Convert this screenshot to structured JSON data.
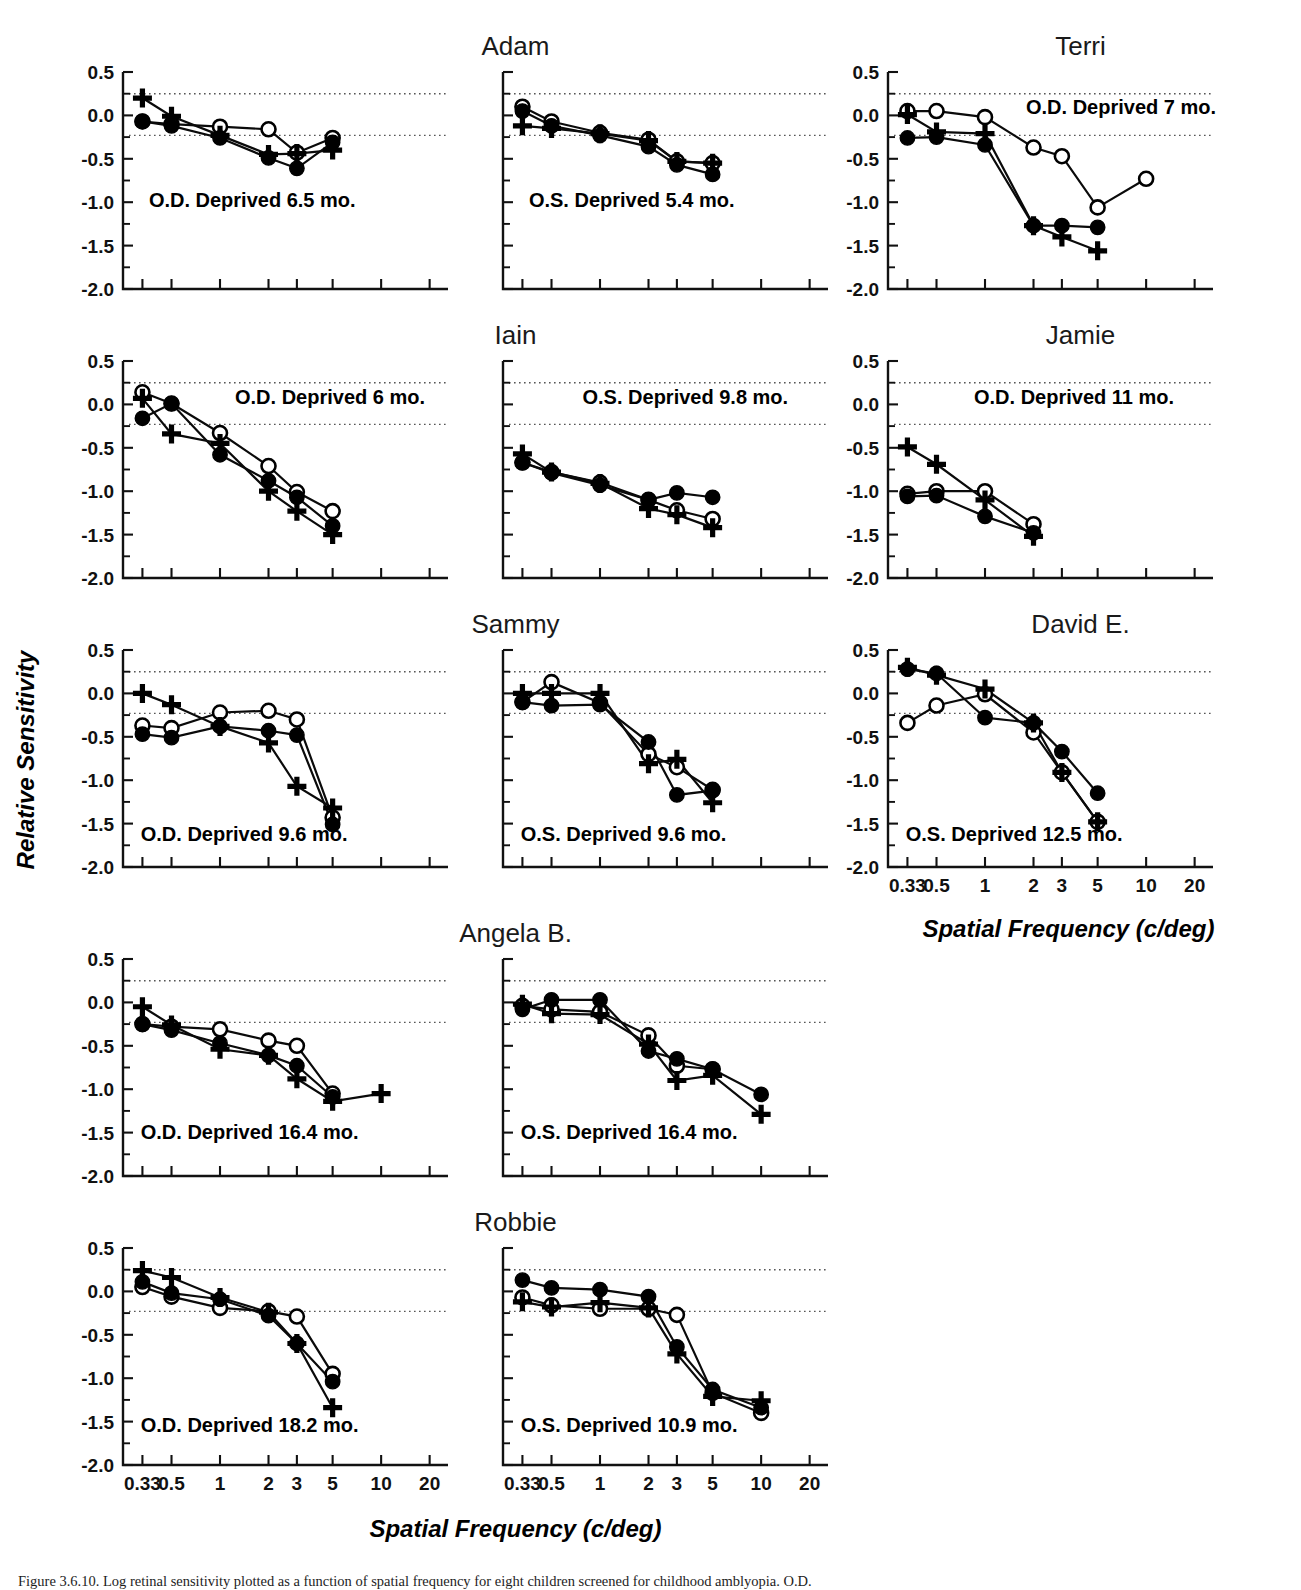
{
  "figure": {
    "axis_labels": {
      "x": "Spatial Frequency (c/deg)",
      "y": "Relative Sensitivity"
    },
    "caption": "Figure 3.6.10.  Log retinal sensitivity plotted as a function of spatial frequency for eight children screened for childhood amblyopia. O.D."
  },
  "chart_data": {
    "type": "line",
    "title": "",
    "xlabel": "Spatial Frequency (c/deg)",
    "ylabel": "Relative Sensitivity",
    "xscale": "log",
    "xlim": [
      0.25,
      26
    ],
    "ylim": [
      -2.0,
      0.5
    ],
    "yticks": [
      0.5,
      0.0,
      -0.5,
      -1.0,
      -1.5,
      -2.0
    ],
    "ytick_labels": [
      "0.5",
      "0.0",
      "-0.5",
      "-1.0",
      "-1.5",
      "-2.0"
    ],
    "xticks": [
      0.33,
      0.5,
      1,
      2,
      3,
      5,
      10,
      20
    ],
    "xtick_labels": [
      "0.33",
      "0.5",
      "1",
      "2",
      "3",
      "5",
      "10",
      "20"
    ],
    "grid": false,
    "reference_lines": [
      0.25,
      -0.23
    ],
    "legend_position": "none",
    "series_names": [
      "open-circle",
      "filled-circle",
      "plus"
    ],
    "panels": [
      {
        "subject": "Adam",
        "eye": "O.D.",
        "annotation": "O.D.  Deprived 6.5 mo.",
        "row": 0,
        "col": 0,
        "series": [
          {
            "name": "open-circle",
            "marker": "open-circle",
            "x": [
              0.33,
              0.5,
              1,
              2,
              3,
              5
            ],
            "y": [
              -0.07,
              -0.1,
              -0.13,
              -0.16,
              -0.43,
              -0.26
            ]
          },
          {
            "name": "filled-circle",
            "marker": "filled-circle",
            "x": [
              0.33,
              0.5,
              1,
              2,
              3,
              5
            ],
            "y": [
              -0.07,
              -0.12,
              -0.26,
              -0.49,
              -0.61,
              -0.31
            ]
          },
          {
            "name": "plus",
            "marker": "plus",
            "x": [
              0.33,
              0.5,
              1,
              2,
              3,
              5
            ],
            "y": [
              0.2,
              -0.01,
              -0.23,
              -0.45,
              -0.44,
              -0.4
            ]
          }
        ]
      },
      {
        "subject": "Adam",
        "eye": "O.S.",
        "annotation": "O.S.  Deprived 5.4 mo.",
        "row": 0,
        "col": 1,
        "series": [
          {
            "name": "open-circle",
            "marker": "open-circle",
            "x": [
              0.33,
              0.5,
              1,
              2,
              3,
              5
            ],
            "y": [
              0.1,
              -0.07,
              -0.2,
              -0.28,
              -0.53,
              -0.55
            ]
          },
          {
            "name": "filled-circle",
            "marker": "filled-circle",
            "x": [
              0.33,
              0.5,
              1,
              2,
              3,
              5
            ],
            "y": [
              0.05,
              -0.12,
              -0.23,
              -0.36,
              -0.57,
              -0.68
            ]
          },
          {
            "name": "plus",
            "marker": "plus",
            "x": [
              0.33,
              0.5,
              1,
              2,
              3,
              5
            ],
            "y": [
              -0.12,
              -0.15,
              -0.21,
              -0.29,
              -0.53,
              -0.55
            ]
          }
        ]
      },
      {
        "subject": "Terri",
        "eye": "O.D.",
        "annotation": "O.D. Deprived 7 mo.",
        "row": 0,
        "col": 2,
        "series": [
          {
            "name": "open-circle",
            "marker": "open-circle",
            "x": [
              0.33,
              0.5,
              1,
              2,
              3,
              5,
              10
            ],
            "y": [
              0.05,
              0.05,
              -0.02,
              -0.37,
              -0.47,
              -1.06,
              -0.73
            ]
          },
          {
            "name": "filled-circle",
            "marker": "filled-circle",
            "x": [
              0.33,
              0.5,
              1,
              2,
              3,
              5
            ],
            "y": [
              -0.26,
              -0.25,
              -0.34,
              -1.27,
              -1.27,
              -1.29
            ]
          },
          {
            "name": "plus",
            "marker": "plus",
            "x": [
              0.33,
              0.5,
              1,
              2,
              3,
              5
            ],
            "y": [
              0.01,
              -0.19,
              -0.21,
              -1.27,
              -1.4,
              -1.56
            ]
          }
        ]
      },
      {
        "subject": "Iain",
        "eye": "O.D.",
        "annotation": "O.D. Deprived 6 mo.",
        "row": 1,
        "col": 0,
        "series": [
          {
            "name": "open-circle",
            "marker": "open-circle",
            "x": [
              0.33,
              0.5,
              1,
              2,
              3,
              5
            ],
            "y": [
              0.14,
              0.01,
              -0.33,
              -0.71,
              -1.01,
              -1.23
            ]
          },
          {
            "name": "filled-circle",
            "marker": "filled-circle",
            "x": [
              0.33,
              0.5,
              1,
              2,
              3,
              5
            ],
            "y": [
              -0.16,
              0.01,
              -0.58,
              -0.88,
              -1.07,
              -1.4
            ]
          },
          {
            "name": "plus",
            "marker": "plus",
            "x": [
              0.33,
              0.5,
              1,
              2,
              3,
              5
            ],
            "y": [
              0.07,
              -0.34,
              -0.45,
              -1.0,
              -1.23,
              -1.5
            ]
          }
        ]
      },
      {
        "subject": "Iain",
        "eye": "O.S.",
        "annotation": "O.S. Deprived 9.8 mo.",
        "row": 1,
        "col": 1,
        "series": [
          {
            "name": "open-circle",
            "marker": "open-circle",
            "x": [
              0.33,
              0.5,
              1,
              2,
              3,
              5
            ],
            "y": [
              -0.67,
              -0.78,
              -0.9,
              -1.1,
              -1.22,
              -1.32
            ]
          },
          {
            "name": "filled-circle",
            "marker": "filled-circle",
            "x": [
              0.33,
              0.5,
              1,
              2,
              3,
              5
            ],
            "y": [
              -0.67,
              -0.79,
              -0.93,
              -1.1,
              -1.02,
              -1.07
            ]
          },
          {
            "name": "plus",
            "marker": "plus",
            "x": [
              0.33,
              0.5,
              1,
              2,
              3,
              5
            ],
            "y": [
              -0.57,
              -0.78,
              -0.91,
              -1.2,
              -1.27,
              -1.42
            ]
          }
        ]
      },
      {
        "subject": "Jamie",
        "eye": "O.D.",
        "annotation": "O.D.  Deprived 11 mo.",
        "row": 1,
        "col": 2,
        "series": [
          {
            "name": "open-circle",
            "marker": "open-circle",
            "x": [
              0.33,
              0.5,
              1,
              2
            ],
            "y": [
              -1.03,
              -1.0,
              -1.0,
              -1.38
            ]
          },
          {
            "name": "filled-circle",
            "marker": "filled-circle",
            "x": [
              0.33,
              0.5,
              1,
              2
            ],
            "y": [
              -1.06,
              -1.05,
              -1.29,
              -1.48
            ]
          },
          {
            "name": "plus",
            "marker": "plus",
            "x": [
              0.33,
              0.5,
              1,
              2
            ],
            "y": [
              -0.49,
              -0.69,
              -1.1,
              -1.52
            ]
          }
        ]
      },
      {
        "subject": "Sammy",
        "eye": "O.D.",
        "annotation": "O.D. Deprived 9.6 mo.",
        "row": 2,
        "col": 0,
        "series": [
          {
            "name": "open-circle",
            "marker": "open-circle",
            "x": [
              0.33,
              0.5,
              1,
              2,
              3,
              5
            ],
            "y": [
              -0.37,
              -0.4,
              -0.22,
              -0.2,
              -0.3,
              -1.43
            ]
          },
          {
            "name": "filled-circle",
            "marker": "filled-circle",
            "x": [
              0.33,
              0.5,
              1,
              2,
              3,
              5
            ],
            "y": [
              -0.47,
              -0.51,
              -0.38,
              -0.43,
              -0.48,
              -1.51
            ]
          },
          {
            "name": "plus",
            "marker": "plus",
            "x": [
              0.33,
              0.5,
              1,
              2,
              3,
              5
            ],
            "y": [
              0.0,
              -0.13,
              -0.38,
              -0.57,
              -1.07,
              -1.32
            ]
          }
        ]
      },
      {
        "subject": "Sammy",
        "eye": "O.S.",
        "annotation": "O.S. Deprived 9.6 mo.",
        "row": 2,
        "col": 1,
        "series": [
          {
            "name": "open-circle",
            "marker": "open-circle",
            "x": [
              0.33,
              0.5,
              1,
              2,
              3,
              5
            ],
            "y": [
              -0.1,
              0.13,
              -0.11,
              -0.7,
              -0.85,
              -1.11
            ]
          },
          {
            "name": "filled-circle",
            "marker": "filled-circle",
            "x": [
              0.33,
              0.5,
              1,
              2,
              3,
              5
            ],
            "y": [
              -0.1,
              -0.14,
              -0.13,
              -0.56,
              -1.17,
              -1.12
            ]
          },
          {
            "name": "plus",
            "marker": "plus",
            "x": [
              0.33,
              0.5,
              1,
              2,
              3,
              5
            ],
            "y": [
              0.0,
              0.0,
              0.0,
              -0.81,
              -0.76,
              -1.26
            ]
          }
        ]
      },
      {
        "subject": "David E.",
        "eye": "O.S.",
        "annotation": "O.S. Deprived 12.5 mo.",
        "row": 2,
        "col": 2,
        "series": [
          {
            "name": "open-circle",
            "marker": "open-circle",
            "x": [
              0.33,
              0.5,
              1,
              2,
              3,
              5
            ],
            "y": [
              -0.34,
              -0.14,
              -0.01,
              -0.45,
              -0.91,
              -1.48
            ]
          },
          {
            "name": "filled-circle",
            "marker": "filled-circle",
            "x": [
              0.33,
              0.5,
              1,
              2,
              3,
              5
            ],
            "y": [
              0.28,
              0.23,
              -0.28,
              -0.34,
              -0.67,
              -1.15
            ]
          },
          {
            "name": "plus",
            "marker": "plus",
            "x": [
              0.33,
              0.5,
              1,
              2,
              3,
              5
            ],
            "y": [
              0.3,
              0.21,
              0.05,
              -0.34,
              -0.91,
              -1.48
            ]
          }
        ]
      },
      {
        "subject": "Angela B.",
        "eye": "O.D.",
        "annotation": "O.D. Deprived 16.4 mo.",
        "row": 3,
        "col": 0,
        "series": [
          {
            "name": "open-circle",
            "marker": "open-circle",
            "x": [
              0.33,
              0.5,
              1,
              2,
              3,
              5
            ],
            "y": [
              -0.25,
              -0.28,
              -0.31,
              -0.44,
              -0.5,
              -1.05
            ]
          },
          {
            "name": "filled-circle",
            "marker": "filled-circle",
            "x": [
              0.33,
              0.5,
              1,
              2,
              3,
              5
            ],
            "y": [
              -0.25,
              -0.32,
              -0.47,
              -0.61,
              -0.73,
              -1.09
            ]
          },
          {
            "name": "plus",
            "marker": "plus",
            "x": [
              0.33,
              0.5,
              1,
              2,
              3,
              5,
              10
            ],
            "y": [
              -0.05,
              -0.26,
              -0.54,
              -0.61,
              -0.88,
              -1.14,
              -1.05
            ]
          }
        ]
      },
      {
        "subject": "Angela B.",
        "eye": "O.S.",
        "annotation": "O.S. Deprived 16.4 mo.",
        "row": 3,
        "col": 1,
        "series": [
          {
            "name": "open-circle",
            "marker": "open-circle",
            "x": [
              0.33,
              0.5,
              1,
              2,
              3,
              5
            ],
            "y": [
              -0.04,
              -0.08,
              -0.11,
              -0.38,
              -0.73,
              -0.77
            ]
          },
          {
            "name": "filled-circle",
            "marker": "filled-circle",
            "x": [
              0.33,
              0.5,
              1,
              2,
              3,
              5,
              10
            ],
            "y": [
              -0.08,
              0.03,
              0.03,
              -0.56,
              -0.65,
              -0.77,
              -1.06
            ]
          },
          {
            "name": "plus",
            "marker": "plus",
            "x": [
              0.33,
              0.5,
              1,
              2,
              3,
              5,
              10
            ],
            "y": [
              -0.02,
              -0.13,
              -0.14,
              -0.48,
              -0.9,
              -0.84,
              -1.29
            ]
          }
        ]
      },
      {
        "subject": "Robbie",
        "eye": "O.D.",
        "annotation": "O.D. Deprived  18.2 mo.",
        "row": 4,
        "col": 0,
        "series": [
          {
            "name": "open-circle",
            "marker": "open-circle",
            "x": [
              0.33,
              0.5,
              1,
              2,
              3,
              5
            ],
            "y": [
              0.05,
              -0.06,
              -0.19,
              -0.23,
              -0.29,
              -0.95
            ]
          },
          {
            "name": "filled-circle",
            "marker": "filled-circle",
            "x": [
              0.33,
              0.5,
              1,
              2,
              3,
              5
            ],
            "y": [
              0.11,
              -0.02,
              -0.09,
              -0.28,
              -0.6,
              -1.04
            ]
          },
          {
            "name": "plus",
            "marker": "plus",
            "x": [
              0.33,
              0.5,
              1,
              2,
              3,
              5
            ],
            "y": [
              0.24,
              0.16,
              -0.07,
              -0.24,
              -0.6,
              -1.34
            ]
          }
        ]
      },
      {
        "subject": "Robbie",
        "eye": "O.S.",
        "annotation": "O.S. Deprived  10.9 mo.",
        "row": 4,
        "col": 1,
        "series": [
          {
            "name": "open-circle",
            "marker": "open-circle",
            "x": [
              0.33,
              0.5,
              1,
              2,
              3,
              5,
              10
            ],
            "y": [
              -0.07,
              -0.16,
              -0.2,
              -0.2,
              -0.27,
              -1.17,
              -1.4
            ]
          },
          {
            "name": "filled-circle",
            "marker": "filled-circle",
            "x": [
              0.33,
              0.5,
              1,
              2,
              3,
              5,
              10
            ],
            "y": [
              0.13,
              0.04,
              0.02,
              -0.06,
              -0.64,
              -1.13,
              -1.34
            ]
          },
          {
            "name": "plus",
            "marker": "plus",
            "x": [
              0.33,
              0.5,
              1,
              2,
              3,
              5,
              10
            ],
            "y": [
              -0.12,
              -0.18,
              -0.13,
              -0.19,
              -0.72,
              -1.21,
              -1.26
            ]
          }
        ]
      }
    ]
  }
}
